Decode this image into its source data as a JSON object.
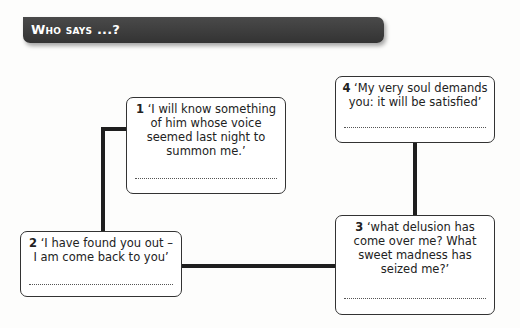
{
  "header": {
    "title": "Who says ...?"
  },
  "quotes": [
    {
      "number": "1",
      "text": "‘I will know something of him whose voice seemed last night to summon me.’",
      "answer": ""
    },
    {
      "number": "2",
      "text": "‘I have found you out – I am come back to you’",
      "answer": ""
    },
    {
      "number": "3",
      "text": "‘what delusion has come over me? What sweet madness has seized me?’",
      "answer": ""
    },
    {
      "number": "4",
      "text": "‘My very soul demands you: it will be satisfied’",
      "answer": ""
    }
  ]
}
